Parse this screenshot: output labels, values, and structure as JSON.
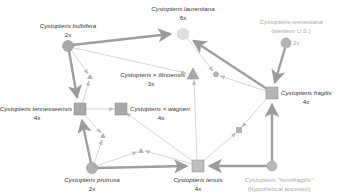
{
  "diagram": {
    "type": "reticulogram",
    "colors": {
      "node_fill": "#a9a9a9",
      "node_stroke": "#949494",
      "faded_node_fill": "#cfcfcf",
      "thick_edge": "#9b9b9b",
      "thin_edge": "#bdbdbd",
      "text": "#333333",
      "faded_text": "#a8a8a8"
    },
    "nodes": [
      {
        "id": "bulbifera",
        "shape": "circle",
        "name": "Cystopteris bulbifera",
        "ploidy": "2x",
        "x": 68,
        "y": 46
      },
      {
        "id": "laurentiana",
        "shape": "hexagon",
        "name": "Cystopteris laurentiana",
        "ploidy": "6x",
        "x": 183,
        "y": 34,
        "faded": true
      },
      {
        "id": "reevesiana",
        "shape": "circle",
        "name": "Cystopteris reevesiana",
        "sub": "(western U.S.)",
        "ploidy": "2x",
        "x": 286,
        "y": 43,
        "faded": true
      },
      {
        "id": "illinoensis",
        "shape": "triangle",
        "name": "Cystopteris × illinoensis",
        "ploidy": "3x",
        "x": 193,
        "y": 74
      },
      {
        "id": "tennesseensis",
        "shape": "square",
        "name": "Cystopteris tennesseensis",
        "ploidy": "4x",
        "x": 80,
        "y": 109
      },
      {
        "id": "wagneri",
        "shape": "square",
        "name": "Cystopteris × wagneri",
        "ploidy": "4x",
        "x": 121,
        "y": 109
      },
      {
        "id": "fragilis",
        "shape": "square",
        "name": "Cystopteris fragilis",
        "ploidy": "4x",
        "x": 272,
        "y": 93
      },
      {
        "id": "protrusa",
        "shape": "circle",
        "name": "Cystopteris protrusa",
        "ploidy": "2x",
        "x": 92,
        "y": 168
      },
      {
        "id": "tenuis",
        "shape": "square",
        "name": "Cystopteris tenuis",
        "ploidy": "4x",
        "x": 198,
        "y": 166
      },
      {
        "id": "hemifragilis",
        "shape": "circle",
        "name": "Cystopteris \"hemifragilis\"",
        "sub": "(hypothetical ancestor)",
        "ploidy": "",
        "x": 272,
        "y": 166,
        "faded": true
      }
    ],
    "small_nodes": [
      {
        "id": "tri_a",
        "shape": "triangle",
        "x": 90,
        "y": 77
      },
      {
        "id": "pent_a",
        "shape": "pentagon",
        "x": 216,
        "y": 74
      },
      {
        "id": "tri_b",
        "shape": "triangle",
        "x": 103,
        "y": 136
      },
      {
        "id": "tri_c",
        "shape": "triangle",
        "x": 141,
        "y": 151
      },
      {
        "id": "sq_small",
        "shape": "square",
        "x": 239,
        "y": 130
      }
    ],
    "labels": {
      "bulbifera_name": "Cystopteris bulbifera",
      "bulbifera_ploidy": "2x",
      "laurentiana_name": "Cystopteris laurentiana",
      "laurentiana_ploidy": "6x",
      "reevesiana_name": "Cystopteris reevesiana",
      "reevesiana_sub": "(western U.S.)",
      "reevesiana_ploidy": "2x",
      "illinoensis_name": "Cystopteris × illinoensis",
      "illinoensis_ploidy": "3x",
      "tennesseensis_name": "Cystopteris tennesseensis",
      "tennesseensis_ploidy": "4x",
      "wagneri_name": "Cystopteris × wagneri",
      "wagneri_ploidy": "4x",
      "fragilis_name": "Cystopteris fragilis",
      "fragilis_ploidy": "4x",
      "protrusa_name": "Cystopteris protrusa",
      "protrusa_ploidy": "2x",
      "tenuis_name": "Cystopteris tenuis",
      "tenuis_ploidy": "4x",
      "hemifragilis_name": "Cystopteris \"hemifragilis\"",
      "hemifragilis_sub": "(hypothetical ancestor)"
    }
  }
}
